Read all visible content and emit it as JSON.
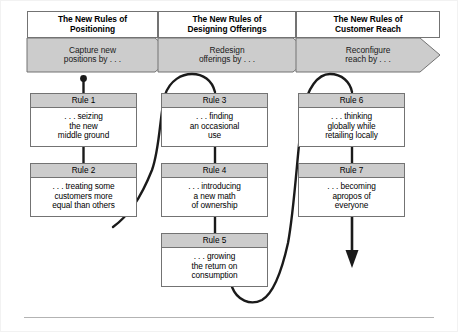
{
  "diagram": {
    "colors": {
      "band_fill": "#cccccc",
      "box_header_fill": "#cccccc",
      "box_fill": "#ffffff",
      "stroke": "#737373",
      "connector": "#1a1a1a",
      "text": "#000000"
    },
    "columns": [
      {
        "heading": "The New Rules of Positioning",
        "heading_line1": "The New Rules of",
        "heading_line2": "Positioning",
        "subheading_line1": "Capture new",
        "subheading_line2": "positions by . . ."
      },
      {
        "heading": "The New Rules of Designing Offerings",
        "heading_line1": "The New Rules of",
        "heading_line2": "Designing Offerings",
        "subheading_line1": "Redesign",
        "subheading_line2": "offerings by . . ."
      },
      {
        "heading": "The New Rules of Customer Reach",
        "heading_line1": "The New Rules of",
        "heading_line2": "Customer Reach",
        "subheading_line1": "Reconfigure",
        "subheading_line2": "reach by . . ."
      }
    ],
    "rules": [
      {
        "id": "rule-1",
        "label": "Rule 1",
        "text": ". . . seizing the new middle ground",
        "lines": [
          ". . . seizing",
          "the new",
          "middle ground"
        ]
      },
      {
        "id": "rule-2",
        "label": "Rule 2",
        "text": ". . . treating some customers more equal than others",
        "lines": [
          ". . . treating some",
          "customers more",
          "equal than others"
        ]
      },
      {
        "id": "rule-3",
        "label": "Rule 3",
        "text": ". . . finding an occasional use",
        "lines": [
          ". . . finding",
          "an occasional",
          "use"
        ]
      },
      {
        "id": "rule-4",
        "label": "Rule 4",
        "text": ". . . introducing a new math of ownership",
        "lines": [
          ". . . introducing",
          "a new math",
          "of ownership"
        ]
      },
      {
        "id": "rule-5",
        "label": "Rule 5",
        "text": ". . . growing the return on consumption",
        "lines": [
          ". . . growing",
          "the return on",
          "consumption"
        ]
      },
      {
        "id": "rule-6",
        "label": "Rule 6",
        "text": ". . . thinking globally while retailing locally",
        "lines": [
          ". . . thinking",
          "globally while",
          "retailing locally"
        ]
      },
      {
        "id": "rule-7",
        "label": "Rule 7",
        "text": ". . . becoming apropos of everyone",
        "lines": [
          ". . . becoming",
          "apropos of",
          "everyone"
        ]
      }
    ]
  }
}
